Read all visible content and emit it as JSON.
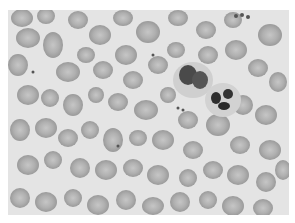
{
  "image": {
    "subject": "blood smear micrograph",
    "description": "Grayscale microscope view of many red blood cells with two white blood cells near the upper right center",
    "background_color": "#e6e6e6",
    "rbc_fill": "#a9a9a9",
    "rbc_center": "#c4c4c4",
    "wbc_nucleus": "#3a3a3a",
    "wbc_cytoplasm": "#cfcfcf"
  }
}
